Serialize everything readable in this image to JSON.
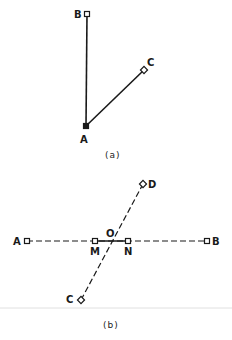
{
  "figure_a": {
    "caption": "(a)",
    "points": {
      "A": {
        "label": "A",
        "x": 86,
        "y": 126,
        "lx": 84,
        "ly": 143
      },
      "B": {
        "label": "B",
        "x": 87,
        "y": 14,
        "lx": 77,
        "ly": 18
      },
      "C": {
        "label": "C",
        "x": 144,
        "y": 70,
        "lx": 150,
        "ly": 66
      }
    },
    "segments": [
      [
        "A",
        "B"
      ],
      [
        "A",
        "C"
      ]
    ]
  },
  "figure_b": {
    "caption": "(b)",
    "points": {
      "A": {
        "label": "A",
        "x": 27,
        "y": 241,
        "lx": 17,
        "ly": 245
      },
      "B": {
        "label": "B",
        "x": 207,
        "y": 241,
        "lx": 216,
        "ly": 245
      },
      "C": {
        "label": "C",
        "x": 81,
        "y": 300,
        "lx": 70,
        "ly": 303
      },
      "D": {
        "label": "D",
        "x": 143,
        "y": 184,
        "lx": 152,
        "ly": 188
      },
      "M": {
        "label": "M",
        "x": 95,
        "y": 241,
        "lx": 94,
        "ly": 255
      },
      "N": {
        "label": "N",
        "x": 128,
        "y": 241,
        "lx": 128,
        "ly": 255
      },
      "O": {
        "label": "O",
        "x": 112,
        "y": 241,
        "lx": 110,
        "ly": 236
      }
    },
    "dashed_segments": [
      [
        "A",
        "B"
      ],
      [
        "C",
        "D"
      ]
    ],
    "solid_segments": [
      [
        "M",
        "N"
      ]
    ]
  },
  "colors": {
    "ink": "#1a1a1a",
    "background": "#ffffff",
    "rule": "#d8d8d8"
  }
}
